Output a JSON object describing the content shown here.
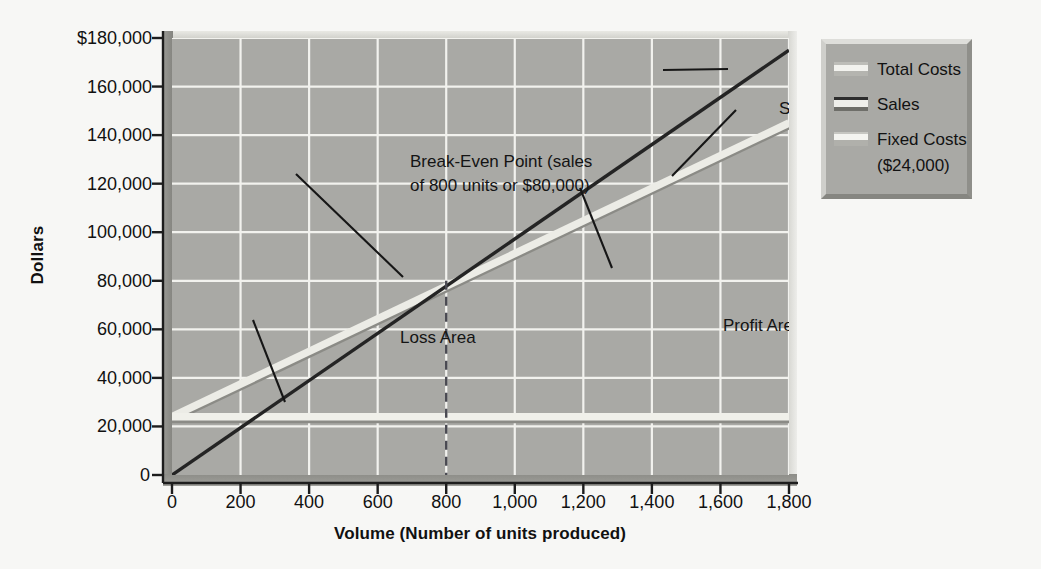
{
  "chart_data": {
    "type": "line",
    "title": "",
    "xlabel": "Volume (Number of units produced)",
    "ylabel": "Dollars",
    "xlim": [
      0,
      1800
    ],
    "ylim": [
      0,
      180000
    ],
    "grid": true,
    "legend_position": "right-outside",
    "x_ticks": [
      "0",
      "200",
      "400",
      "600",
      "800",
      "1,000",
      "1,200",
      "1,400",
      "1,600",
      "1,800"
    ],
    "x_tick_values": [
      0,
      200,
      400,
      600,
      800,
      1000,
      1200,
      1400,
      1600,
      1800
    ],
    "y_ticks": [
      "0",
      "20,000",
      "40,000",
      "60,000",
      "80,000",
      "100,000",
      "120,000",
      "140,000",
      "160,000",
      "$180,000"
    ],
    "y_tick_values": [
      0,
      20000,
      40000,
      60000,
      80000,
      100000,
      120000,
      140000,
      160000,
      180000
    ],
    "x": [
      0,
      1800
    ],
    "series": [
      {
        "name": "Sales",
        "values": [
          0,
          175000
        ],
        "color": "#242424",
        "style": "solid"
      },
      {
        "name": "Total Costs",
        "values": [
          24000,
          145000
        ],
        "color": "#ececE6",
        "style": "solid"
      },
      {
        "name": "Fixed Costs",
        "values": [
          24000,
          24000
        ],
        "color": "#f0f0ea",
        "style": "solid"
      }
    ],
    "break_even": {
      "units": 800,
      "dollars": 80000
    },
    "annotations": [
      {
        "name": "break-even-point",
        "text": "Break-Even Point (sales\nof 800 units or $80,000)",
        "points_to": [
          800,
          80000
        ]
      },
      {
        "name": "loss-area",
        "text": "Loss Area",
        "points_to": [
          290,
          30000
        ]
      },
      {
        "name": "profit-area",
        "text": "Profit Area",
        "points_to": [
          1290,
          122000
        ]
      },
      {
        "name": "sales-line",
        "text": "Sales",
        "points_to": [
          1660,
          164000
        ]
      },
      {
        "name": "total-costs-line",
        "text": "Total Costs",
        "points_to": [
          1585,
          131000
        ]
      }
    ]
  },
  "axes": {
    "y_title": "Dollars",
    "x_title": "Volume (Number of units produced)",
    "y_tick_labels": [
      "$180,000",
      "160,000",
      "140,000",
      "120,000",
      "100,000",
      "80,000",
      "60,000",
      "40,000",
      "20,000",
      "0"
    ],
    "x_tick_labels": [
      "0",
      "200",
      "400",
      "600",
      "800",
      "1,000",
      "1,200",
      "1,400",
      "1,600",
      "1,800"
    ],
    "y_origin_label": "0"
  },
  "annotations": {
    "break_even_line1": "Break-Even Point (sales",
    "break_even_line2": "of 800 units or $80,000)",
    "loss_area": "Loss Area",
    "profit_area": "Profit Area",
    "sales": "Sales",
    "total_costs": "Total Costs"
  },
  "legend": {
    "items": [
      {
        "label": "Total Costs",
        "sub": "",
        "swatch": "total-costs-swatch",
        "color": "#ececE6"
      },
      {
        "label": "Sales",
        "sub": "",
        "swatch": "sales-swatch",
        "color": "#242424"
      },
      {
        "label": "Fixed Costs",
        "sub": "($24,000)",
        "swatch": "fixed-costs-swatch",
        "color": "#f0f0ea"
      }
    ]
  },
  "colors": {
    "page_background": "#f7f7f5",
    "plot_background": "#a9a9a5",
    "gridline": "#f2f2ee",
    "sales_line": "#242424",
    "total_costs_line": "#ececE6",
    "fixed_costs_line": "#f0f0ea",
    "text": "#111111"
  }
}
